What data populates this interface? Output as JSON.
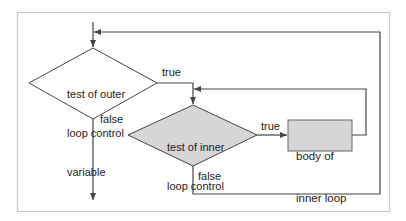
{
  "diagram": {
    "type": "flowchart",
    "colors": {
      "frame": "#c8c8c8",
      "line": "#444444",
      "shape_fill_plain": "#ffffff",
      "shape_fill_shaded": "#d6d6d6",
      "text": "#222222"
    },
    "nodes": {
      "outer_test": {
        "shape": "diamond",
        "lines": [
          "test of outer",
          "loop control",
          "variable"
        ]
      },
      "inner_test": {
        "shape": "diamond",
        "shaded": true,
        "lines": [
          "test of inner",
          "loop control",
          "variable"
        ]
      },
      "inner_body": {
        "shape": "rectangle",
        "shaded": true,
        "lines": [
          "body of",
          "inner loop"
        ]
      }
    },
    "edges": {
      "outer_true": "true",
      "outer_false": "false",
      "inner_true": "true",
      "inner_false": "false"
    }
  }
}
